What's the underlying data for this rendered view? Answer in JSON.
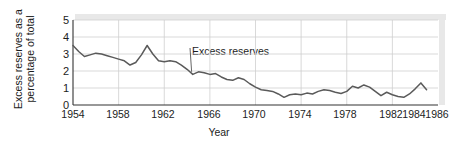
{
  "chart_data": {
    "type": "line",
    "title": "",
    "xlabel": "Year",
    "ylabel": "Excess reserves as a percentage of total",
    "ylabel_line1": "Excess reserves as a",
    "ylabel_line2": "percentage of total",
    "xlim": [
      1954,
      1986
    ],
    "ylim": [
      0,
      5
    ],
    "yticks": [
      "5",
      "4",
      "3",
      "2",
      "1",
      "0"
    ],
    "ytick_values": [
      5,
      4,
      3,
      2,
      1,
      0
    ],
    "xticks": [
      "1954",
      "1958",
      "1962",
      "1966",
      "1970",
      "1974",
      "1978",
      "1982",
      "1984",
      "1986"
    ],
    "xtick_values": [
      1954,
      1958,
      1962,
      1966,
      1970,
      1974,
      1978,
      1982,
      1984,
      1986
    ],
    "grid": true,
    "legend": "none",
    "annotations": [
      {
        "text": "Excess reserves",
        "points_to_x": 1964.4,
        "points_to_y": 1.95
      }
    ],
    "series": [
      {
        "name": "Excess reserves",
        "color": "#5a5a5a",
        "x": [
          1954,
          1954.5,
          1955,
          1955.5,
          1956,
          1956.5,
          1957,
          1957.5,
          1958,
          1958.5,
          1959,
          1959.5,
          1960,
          1960.5,
          1961,
          1961.5,
          1962,
          1962.5,
          1963,
          1963.5,
          1964,
          1964.5,
          1965,
          1965.5,
          1966,
          1966.5,
          1967,
          1967.5,
          1968,
          1968.5,
          1969,
          1969.5,
          1970,
          1970.5,
          1971,
          1971.5,
          1972,
          1972.5,
          1973,
          1973.5,
          1974,
          1974.5,
          1975,
          1975.5,
          1976,
          1976.5,
          1977,
          1977.5,
          1978,
          1978.5,
          1979,
          1979.5,
          1980,
          1980.5,
          1981,
          1981.5,
          1982,
          1982.5,
          1983,
          1983.5,
          1984,
          1984.5,
          1985
        ],
        "y": [
          3.5,
          3.15,
          2.85,
          2.95,
          3.05,
          3.0,
          2.9,
          2.8,
          2.7,
          2.6,
          2.35,
          2.5,
          2.95,
          3.5,
          3.0,
          2.6,
          2.55,
          2.6,
          2.55,
          2.35,
          2.1,
          1.8,
          1.95,
          1.9,
          1.8,
          1.85,
          1.65,
          1.5,
          1.45,
          1.6,
          1.5,
          1.25,
          1.05,
          0.9,
          0.85,
          0.8,
          0.65,
          0.45,
          0.6,
          0.65,
          0.6,
          0.7,
          0.65,
          0.8,
          0.9,
          0.85,
          0.75,
          0.68,
          0.8,
          1.1,
          1.0,
          1.18,
          1.05,
          0.8,
          0.55,
          0.75,
          0.6,
          0.5,
          0.45,
          0.65,
          0.95,
          1.3,
          0.9
        ]
      }
    ]
  },
  "axes": {
    "year_label": "Year"
  }
}
